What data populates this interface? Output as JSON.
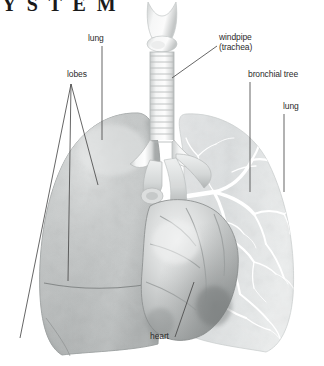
{
  "page": {
    "title_partial": "Y S T E M",
    "background_color": "#ffffff",
    "label_color": "#2b2b2b",
    "leader_line_color": "#4a4a4a",
    "width": 324,
    "height": 366
  },
  "diagram": {
    "style": "grayscale medical illustration",
    "labels": [
      {
        "id": "lung-left",
        "text": "lung",
        "icon": "leader-line-vertical"
      },
      {
        "id": "lobes",
        "text": "lobes",
        "icon": "leader-line-fan-three"
      },
      {
        "id": "windpipe",
        "text": "windpipe",
        "text2": "(trachea)",
        "icon": "leader-line-diagonal"
      },
      {
        "id": "bronchial-tree",
        "text": "bronchial tree",
        "icon": "leader-line-vertical"
      },
      {
        "id": "lung-right",
        "text": "lung",
        "icon": "leader-line-vertical"
      },
      {
        "id": "heart",
        "text": "heart",
        "icon": "leader-line-diagonal"
      }
    ],
    "structures": [
      {
        "id": "larynx",
        "name": "larynx"
      },
      {
        "id": "trachea",
        "name": "trachea with cartilage rings"
      },
      {
        "id": "lung-left",
        "name": "left lung (opaque, lobed)"
      },
      {
        "id": "lung-right",
        "name": "right lung (translucent, bronchial tree visible)"
      },
      {
        "id": "bronchial",
        "name": "bronchial tree"
      },
      {
        "id": "heart",
        "name": "heart"
      }
    ]
  }
}
